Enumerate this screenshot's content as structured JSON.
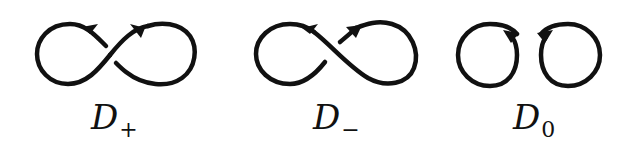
{
  "figure": {
    "stroke_color": "#111111",
    "background": "#ffffff",
    "diagrams": [
      {
        "id": "d-plus",
        "label_main": "D",
        "label_sub": "+",
        "type": "figure-eight with positive crossing",
        "over_strand": "bottom-left to top-right"
      },
      {
        "id": "d-minus",
        "label_main": "D",
        "label_sub": "−",
        "type": "figure-eight with negative crossing",
        "over_strand": "top-left to bottom-right"
      },
      {
        "id": "d-zero",
        "label_main": "D",
        "label_sub": "0",
        "type": "two separate oriented circles (smoothing)"
      }
    ]
  }
}
